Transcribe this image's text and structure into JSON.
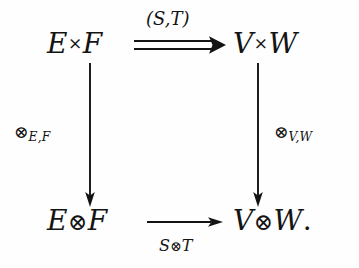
{
  "diagram": {
    "kind": "commutative-diagram",
    "background_color": "#fefefe",
    "ink_color": "#141414",
    "nodes": [
      {
        "id": "top-left",
        "text": "E × F",
        "left": "E",
        "operator": "×",
        "right": "F",
        "position": "top-left"
      },
      {
        "id": "top-right",
        "text": "V × W",
        "left": "V",
        "operator": "×",
        "right": "W",
        "position": "top-right"
      },
      {
        "id": "bottom-left",
        "text": "E ⊗ F",
        "left": "E",
        "operator": "⊗",
        "right": "F",
        "position": "bottom-left"
      },
      {
        "id": "bottom-right",
        "text": "V ⊗ W.",
        "left": "V",
        "operator": "⊗",
        "right": "W",
        "trailing_punctuation": ".",
        "position": "bottom-right"
      }
    ],
    "arrows": [
      {
        "id": "top-arrow",
        "from": "top-left",
        "to": "top-right",
        "style": "double",
        "direction": "right",
        "label": "(S,T)",
        "label_position": "above"
      },
      {
        "id": "bottom-arrow",
        "from": "bottom-left",
        "to": "bottom-right",
        "style": "single",
        "direction": "right",
        "label_symbol_left": "S",
        "label_operator": "⊗",
        "label_symbol_right": "T",
        "label": "S⊗T",
        "label_position": "below"
      },
      {
        "id": "left-arrow",
        "from": "top-left",
        "to": "bottom-left",
        "style": "single",
        "direction": "down",
        "label_operator": "⊗",
        "label_subscript": "E,F",
        "label": "⊗E,F",
        "label_position": "left"
      },
      {
        "id": "right-arrow",
        "from": "top-right",
        "to": "bottom-right",
        "style": "single",
        "direction": "down",
        "label_operator": "⊗",
        "label_subscript": "V,W",
        "label": "⊗V,W",
        "label_position": "right"
      }
    ]
  }
}
